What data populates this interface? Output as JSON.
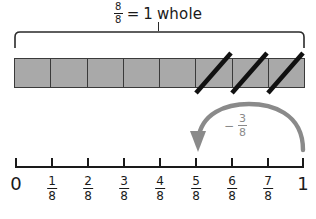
{
  "title": {
    "fraction": {
      "numerator": "8",
      "denominator": "8"
    },
    "equals": "=",
    "one": "1",
    "whole_word": "whole",
    "full_text": "8/8 = 1 whole"
  },
  "bar_model": {
    "total_parts": 8,
    "crossed_out_parts": 3,
    "crossed_out_indices": [
      5,
      6,
      7
    ],
    "fill_color": "#a9a9a9",
    "border_color": "#3a3a3a",
    "slash_color": "#111111",
    "cells": [
      {
        "index": 0,
        "crossed": false
      },
      {
        "index": 1,
        "crossed": false
      },
      {
        "index": 2,
        "crossed": false
      },
      {
        "index": 3,
        "crossed": false
      },
      {
        "index": 4,
        "crossed": false
      },
      {
        "index": 5,
        "crossed": true
      },
      {
        "index": 6,
        "crossed": true
      },
      {
        "index": 7,
        "crossed": true
      }
    ]
  },
  "jump": {
    "operator": "−",
    "fraction": {
      "numerator": "3",
      "denominator": "8"
    },
    "label_text": "− 3/8",
    "direction": "left",
    "from_value": "1",
    "to_value": "5/8",
    "color": "#8a8a8a"
  },
  "number_line": {
    "axis_color": "#1a1a1a",
    "start_label": "0",
    "end_label": "1",
    "ticks": [
      {
        "position": 0,
        "label_type": "whole",
        "whole": "0"
      },
      {
        "position": 1,
        "label_type": "fraction",
        "numerator": "1",
        "denominator": "8"
      },
      {
        "position": 2,
        "label_type": "fraction",
        "numerator": "2",
        "denominator": "8"
      },
      {
        "position": 3,
        "label_type": "fraction",
        "numerator": "3",
        "denominator": "8"
      },
      {
        "position": 4,
        "label_type": "fraction",
        "numerator": "4",
        "denominator": "8"
      },
      {
        "position": 5,
        "label_type": "fraction",
        "numerator": "5",
        "denominator": "8"
      },
      {
        "position": 6,
        "label_type": "fraction",
        "numerator": "6",
        "denominator": "8"
      },
      {
        "position": 7,
        "label_type": "fraction",
        "numerator": "7",
        "denominator": "8"
      },
      {
        "position": 8,
        "label_type": "whole",
        "whole": "1"
      }
    ]
  }
}
